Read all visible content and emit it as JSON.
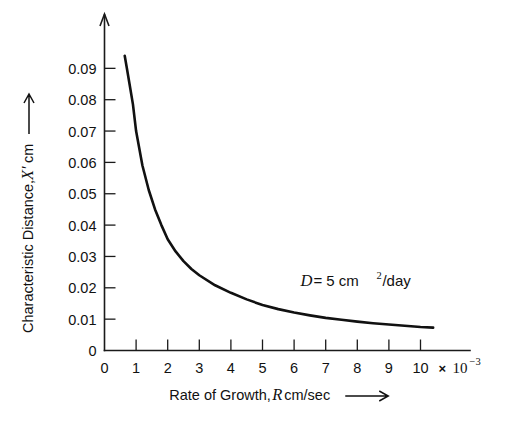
{
  "chart_data": {
    "type": "line",
    "title": "",
    "xlabel": "Rate of Growth, R cm/sec",
    "ylabel": "Characteristic Distance, X' cm",
    "xlabel_parts": {
      "prefix": "Rate of Growth, ",
      "variable": "R",
      "suffix": " cm/sec",
      "arrow": "⟶"
    },
    "ylabel_parts": {
      "prefix": "Characteristic Distance, ",
      "variable": "X′",
      "suffix": " cm",
      "arrow": "⟶"
    },
    "x_multiplier_label": "× 10",
    "x_multiplier_exponent": "−3",
    "x_multiplier_value": 0.001,
    "xlim": [
      0,
      10.6
    ],
    "ylim": [
      0,
      0.0975
    ],
    "grid": false,
    "legend": "none",
    "annotations": [
      {
        "name": "diffusivity-annotation",
        "variable": "D",
        "text": " = 5 cm",
        "exponent": "2",
        "tail": "/day",
        "x": 6.2,
        "y": 0.0205
      }
    ],
    "x_ticks": [
      {
        "value": 0,
        "label": "0"
      },
      {
        "value": 1,
        "label": "1"
      },
      {
        "value": 2,
        "label": "2"
      },
      {
        "value": 3,
        "label": "3"
      },
      {
        "value": 4,
        "label": "4"
      },
      {
        "value": 5,
        "label": "5"
      },
      {
        "value": 6,
        "label": "6"
      },
      {
        "value": 7,
        "label": "7"
      },
      {
        "value": 8,
        "label": "8"
      },
      {
        "value": 9,
        "label": "9"
      },
      {
        "value": 10,
        "label": "10"
      }
    ],
    "y_ticks": [
      {
        "value": 0,
        "label": "0"
      },
      {
        "value": 0.01,
        "label": "0.01"
      },
      {
        "value": 0.02,
        "label": "0.02"
      },
      {
        "value": 0.03,
        "label": "0.03"
      },
      {
        "value": 0.04,
        "label": "0.04"
      },
      {
        "value": 0.05,
        "label": "0.05"
      },
      {
        "value": 0.06,
        "label": "0.06"
      },
      {
        "value": 0.07,
        "label": "0.07"
      },
      {
        "value": 0.08,
        "label": "0.08"
      },
      {
        "value": 0.09,
        "label": "0.09"
      }
    ],
    "series": [
      {
        "name": "characteristic-distance-curve",
        "color": "#111111",
        "line_width": 2.6,
        "relation": "X' = 0.0695 / R  (R in units of 10^-3 cm/sec)",
        "x": [
          0.64,
          0.7,
          0.8,
          0.9,
          1.0,
          1.2,
          1.4,
          1.6,
          1.8,
          2.0,
          2.25,
          2.5,
          2.75,
          3.0,
          3.5,
          4.0,
          4.5,
          5.0,
          5.5,
          6.0,
          6.5,
          7.0,
          7.5,
          8.0,
          8.5,
          9.0,
          9.5,
          10.0,
          10.4
        ],
        "y": [
          0.094,
          0.0905,
          0.0845,
          0.0785,
          0.07,
          0.059,
          0.0512,
          0.045,
          0.04,
          0.0355,
          0.0316,
          0.0285,
          0.026,
          0.024,
          0.0208,
          0.0184,
          0.0163,
          0.0145,
          0.0132,
          0.0121,
          0.0112,
          0.0104,
          0.0098,
          0.0092,
          0.0087,
          0.0083,
          0.0079,
          0.0075,
          0.0073
        ]
      }
    ],
    "colors": {
      "axis": "#1a1a1a",
      "curve": "#111111",
      "background": "#ffffff",
      "text": "#111111"
    }
  }
}
